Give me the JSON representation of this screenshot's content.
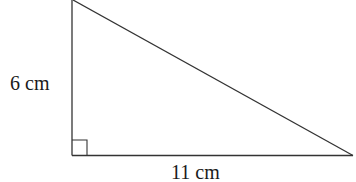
{
  "diagram": {
    "type": "right-triangle",
    "labels": {
      "height": "6 cm",
      "base": "11 cm"
    },
    "stroke_color": "#333333",
    "right_angle_marker": true
  }
}
